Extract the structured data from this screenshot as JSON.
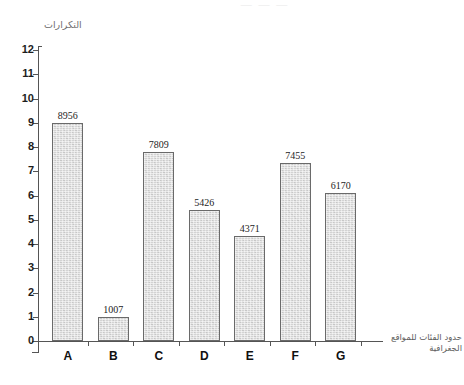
{
  "figure": {
    "background_color": "#ffffff",
    "top_artifact_text": "— — —",
    "bar_fill_color": "#d3d3d3",
    "bar_border_color": "#6a6a6a",
    "axis_color": "#555555"
  },
  "chart_data": {
    "type": "bar",
    "title": "",
    "xlabel": "حدود الفئات للمواقع الجغرافية",
    "xlabel_line1": "حدود الفئات للمواقع",
    "xlabel_line2": "الجغرافية",
    "ylabel": "التكرارات",
    "categories": [
      "A",
      "B",
      "C",
      "D",
      "E",
      "F",
      "G"
    ],
    "values": [
      8956,
      1007,
      7809,
      5426,
      4371,
      7455,
      6170
    ],
    "plotted_values": [
      9.0,
      1.0,
      7.8,
      5.4,
      4.35,
      7.35,
      6.1
    ],
    "data_labels": [
      "8956",
      "1007",
      "7809",
      "5426",
      "4371",
      "7455",
      "6170"
    ],
    "ylim": [
      0,
      12
    ],
    "ytick_labels": [
      "0",
      "1",
      "2",
      "3",
      "4",
      "5",
      "6",
      "7",
      "8",
      "9",
      "10",
      "11",
      "12"
    ],
    "ytick_values": [
      0,
      1,
      2,
      3,
      4,
      5,
      6,
      7,
      8,
      9,
      10,
      11,
      12
    ],
    "grid": false,
    "legend": false,
    "legend_position": "none",
    "value_scale_note": "bar height in axis units ≈ value / 1000"
  }
}
